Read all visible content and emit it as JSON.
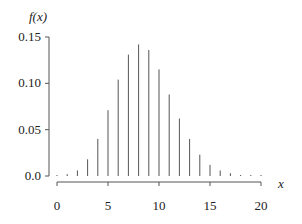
{
  "chart_data": {
    "type": "bar",
    "subtype": "stem",
    "title": "",
    "xlabel": "x",
    "ylabel": "f(x)",
    "x": [
      0,
      1,
      2,
      3,
      4,
      5,
      6,
      7,
      8,
      9,
      10,
      11,
      12,
      13,
      14,
      15,
      16,
      17,
      18,
      19,
      20
    ],
    "values": [
      0.0002,
      0.002,
      0.006,
      0.018,
      0.04,
      0.071,
      0.104,
      0.131,
      0.142,
      0.136,
      0.115,
      0.088,
      0.062,
      0.04,
      0.023,
      0.012,
      0.006,
      0.003,
      0.001,
      0.001,
      0.0005
    ],
    "xlim": [
      0,
      20
    ],
    "ylim": [
      0,
      0.15
    ],
    "xticks": [
      0,
      5,
      10,
      15,
      20
    ],
    "xtick_labels": [
      "0",
      "5",
      "10",
      "15",
      "20"
    ],
    "yticks": [
      0.0,
      0.05,
      0.1,
      0.15
    ],
    "ytick_labels": [
      "0.0",
      "0.05",
      "0.10",
      "0.15"
    ],
    "grid": false,
    "legend": null,
    "colors": {
      "stem": "#555555",
      "axis": "#555555",
      "text": "#222222"
    }
  }
}
